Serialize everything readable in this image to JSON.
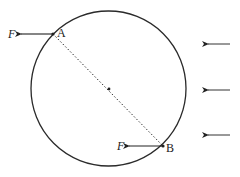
{
  "diagram": {
    "type": "physics-force-diagram",
    "circle": {
      "cx": 108.5,
      "cy": 88.5,
      "r": 77.5,
      "stroke": "#2a2a2a"
    },
    "center_dot": {
      "x": 109,
      "y": 89
    },
    "diameter_line": {
      "style": "dotted",
      "from": "A",
      "to": "B"
    },
    "points": [
      {
        "id": "A",
        "label": "A",
        "x": 53,
        "y": 34
      },
      {
        "id": "B",
        "label": "B",
        "x": 163,
        "y": 146
      }
    ],
    "forces": [
      {
        "label": "F",
        "at": "A",
        "direction": "left",
        "from_x": 53,
        "to_x": 20,
        "y": 34
      },
      {
        "label": "F",
        "at": "B",
        "direction": "left",
        "from_x": 163,
        "to_x": 128,
        "y": 146
      }
    ],
    "field_arrows": [
      {
        "direction": "left",
        "from_x": 230,
        "to_x": 207,
        "y": 44
      },
      {
        "direction": "left",
        "from_x": 230,
        "to_x": 207,
        "y": 90
      },
      {
        "direction": "left",
        "from_x": 230,
        "to_x": 207,
        "y": 135
      }
    ]
  },
  "labels": {
    "force_a": "F",
    "force_b": "F",
    "point_a": "A",
    "point_b": "B"
  }
}
